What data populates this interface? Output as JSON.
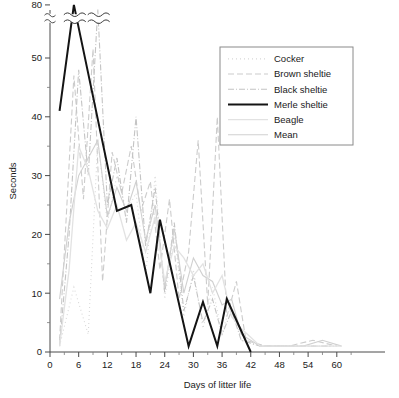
{
  "chart_data": {
    "type": "line",
    "title": "",
    "xlabel": "Days of litter life",
    "ylabel": "Seconds",
    "xlim": [
      0,
      63
    ],
    "ylim": [
      0,
      80
    ],
    "y_axis_break": {
      "present": true,
      "below": 56,
      "above": 76,
      "top_tick": 80
    },
    "xticks": [
      0,
      6,
      12,
      18,
      24,
      30,
      36,
      42,
      48,
      54,
      60
    ],
    "xtick_labels": [
      "0",
      "6",
      "12",
      "18",
      "24",
      "30",
      "36",
      "42",
      "48",
      "54",
      "60"
    ],
    "yticks": [
      0,
      10,
      20,
      30,
      40,
      50,
      80
    ],
    "ytick_labels": [
      "0",
      "10",
      "20",
      "30",
      "40",
      "50",
      "80"
    ],
    "yminor": [
      5,
      15,
      25,
      35,
      45
    ],
    "grid": false,
    "legend_position": "upper right",
    "series": [
      {
        "name": "Cocker",
        "color": "#d8d8d8",
        "dash": "1,3",
        "width": 1.1,
        "points": [
          [
            2,
            1
          ],
          [
            5,
            11
          ],
          [
            8,
            3
          ],
          [
            10,
            36
          ],
          [
            12,
            22
          ],
          [
            14,
            30
          ],
          [
            16,
            24
          ],
          [
            18,
            27
          ],
          [
            20,
            13
          ],
          [
            22,
            30
          ],
          [
            24,
            9
          ],
          [
            26,
            20
          ],
          [
            28,
            6
          ],
          [
            30,
            14
          ],
          [
            32,
            4
          ],
          [
            34,
            11
          ],
          [
            36,
            3
          ],
          [
            38,
            9
          ],
          [
            40,
            2
          ],
          [
            44,
            1
          ],
          [
            48,
            1
          ],
          [
            52,
            1
          ],
          [
            56,
            1
          ],
          [
            60,
            1
          ]
        ]
      },
      {
        "name": "Brown sheltie",
        "color": "#cccccc",
        "dash": "6,3",
        "width": 1.1,
        "points": [
          [
            2,
            2
          ],
          [
            5,
            47
          ],
          [
            7,
            26
          ],
          [
            9,
            60
          ],
          [
            11,
            12
          ],
          [
            13,
            34
          ],
          [
            15,
            27
          ],
          [
            17,
            35
          ],
          [
            19,
            24
          ],
          [
            21,
            29
          ],
          [
            23,
            14
          ],
          [
            25,
            26
          ],
          [
            27,
            9
          ],
          [
            29,
            17
          ],
          [
            31,
            36
          ],
          [
            33,
            8
          ],
          [
            35,
            40
          ],
          [
            37,
            6
          ],
          [
            39,
            12
          ],
          [
            41,
            2
          ],
          [
            45,
            1
          ],
          [
            50,
            1
          ],
          [
            55,
            2
          ],
          [
            60,
            1
          ]
        ]
      },
      {
        "name": "Black sheltie",
        "color": "#c4c4c4",
        "dash": "6,2,1,2",
        "width": 1.1,
        "points": [
          [
            2,
            1
          ],
          [
            4,
            20
          ],
          [
            6,
            48
          ],
          [
            8,
            30
          ],
          [
            10,
            78
          ],
          [
            12,
            25
          ],
          [
            14,
            33
          ],
          [
            16,
            22
          ],
          [
            18,
            40
          ],
          [
            20,
            18
          ],
          [
            22,
            28
          ],
          [
            24,
            10
          ],
          [
            26,
            22
          ],
          [
            28,
            7
          ],
          [
            30,
            13
          ],
          [
            32,
            5
          ],
          [
            34,
            9
          ],
          [
            36,
            3
          ],
          [
            38,
            7
          ],
          [
            40,
            2
          ],
          [
            44,
            1
          ],
          [
            49,
            1
          ],
          [
            54,
            1
          ],
          [
            59,
            1
          ]
        ]
      },
      {
        "name": "Merle sheltie",
        "color": "#141414",
        "dash": "none",
        "width": 2.0,
        "points": [
          [
            2,
            41
          ],
          [
            5,
            80
          ],
          [
            14,
            24
          ],
          [
            17,
            25
          ],
          [
            21,
            10
          ],
          [
            23,
            22.5
          ],
          [
            29,
            1
          ],
          [
            32,
            8.5
          ],
          [
            35,
            1
          ],
          [
            37,
            9
          ],
          [
            42,
            0
          ]
        ]
      },
      {
        "name": "Beagle",
        "color": "#e2e2e2",
        "dash": "none",
        "width": 1.3,
        "points": [
          [
            2,
            1
          ],
          [
            4,
            14
          ],
          [
            6,
            35
          ],
          [
            8,
            31
          ],
          [
            10,
            24
          ],
          [
            12,
            21
          ],
          [
            14,
            25
          ],
          [
            16,
            19
          ],
          [
            18,
            22
          ],
          [
            20,
            17
          ],
          [
            22,
            23
          ],
          [
            24,
            12
          ],
          [
            26,
            18
          ],
          [
            28,
            16
          ],
          [
            30,
            13
          ],
          [
            32,
            15
          ],
          [
            34,
            10
          ],
          [
            36,
            13
          ],
          [
            38,
            6
          ],
          [
            40,
            4
          ],
          [
            44,
            1
          ],
          [
            48,
            1
          ],
          [
            53,
            1
          ],
          [
            58,
            1
          ],
          [
            61,
            1
          ]
        ]
      },
      {
        "name": "Mean",
        "color": "#d0d0d0",
        "dash": "none",
        "width": 1.1,
        "points": [
          [
            2,
            9
          ],
          [
            4,
            22
          ],
          [
            6,
            30
          ],
          [
            8,
            33
          ],
          [
            10,
            36
          ],
          [
            12,
            23
          ],
          [
            14,
            28
          ],
          [
            16,
            24
          ],
          [
            18,
            29
          ],
          [
            20,
            19
          ],
          [
            22,
            25
          ],
          [
            24,
            11
          ],
          [
            26,
            21
          ],
          [
            28,
            10
          ],
          [
            30,
            16
          ],
          [
            32,
            13
          ],
          [
            34,
            12
          ],
          [
            36,
            8
          ],
          [
            38,
            9
          ],
          [
            40,
            3
          ],
          [
            44,
            1
          ],
          [
            48,
            1
          ],
          [
            53,
            1
          ],
          [
            57,
            2
          ],
          [
            61,
            1
          ]
        ]
      }
    ],
    "break_marks_in_plot": [
      {
        "x_center": 5.2,
        "note": "axis-break squiggle across merle peak"
      },
      {
        "x_center": 10.2,
        "note": "axis-break squiggle across black sheltie peak"
      }
    ]
  },
  "legend": {
    "items": [
      {
        "label": "Cocker"
      },
      {
        "label": "Brown sheltie"
      },
      {
        "label": "Black sheltie"
      },
      {
        "label": "Merle sheltie"
      },
      {
        "label": "Beagle"
      },
      {
        "label": "Mean"
      }
    ]
  }
}
